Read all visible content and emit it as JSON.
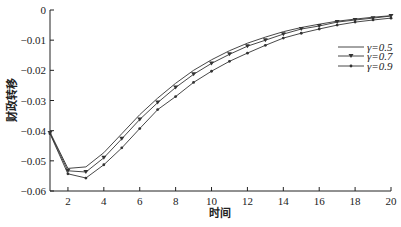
{
  "chart_data": {
    "type": "line",
    "title": "",
    "xlabel": "时间",
    "ylabel": "财政转移",
    "xlim": [
      1,
      20
    ],
    "ylim": [
      -0.06,
      0
    ],
    "grid": false,
    "legend_position": "upper right (inside)",
    "x_ticks": [
      2,
      4,
      6,
      8,
      10,
      12,
      14,
      16,
      18,
      20
    ],
    "y_ticks": [
      0,
      -0.01,
      -0.02,
      -0.03,
      -0.04,
      -0.05,
      -0.06
    ],
    "y_tick_labels": [
      "0",
      "-0.01",
      "-0.02",
      "-0.03",
      "-0.04",
      "-0.05",
      "-0.06"
    ],
    "x": [
      1,
      2,
      3,
      4,
      5,
      6,
      7,
      8,
      9,
      10,
      11,
      12,
      13,
      14,
      15,
      16,
      17,
      18,
      19,
      20
    ],
    "series": [
      {
        "name": "γ=0.5",
        "marker": "none",
        "values": [
          -0.0405,
          -0.0525,
          -0.052,
          -0.0473,
          -0.041,
          -0.0347,
          -0.0292,
          -0.0243,
          -0.02,
          -0.0165,
          -0.0135,
          -0.011,
          -0.009,
          -0.0072,
          -0.0058,
          -0.0047,
          -0.0037,
          -0.003,
          -0.0024,
          -0.0019
        ]
      },
      {
        "name": "γ=0.7",
        "marker": "triangle-down",
        "values": [
          -0.0408,
          -0.0533,
          -0.0537,
          -0.049,
          -0.0427,
          -0.0363,
          -0.0307,
          -0.0257,
          -0.0213,
          -0.0177,
          -0.0147,
          -0.012,
          -0.01,
          -0.008,
          -0.0063,
          -0.0053,
          -0.004,
          -0.0033,
          -0.0027,
          -0.002
        ]
      },
      {
        "name": "γ=0.9",
        "marker": "dot",
        "values": [
          -0.041,
          -0.0543,
          -0.0557,
          -0.0513,
          -0.0457,
          -0.0393,
          -0.033,
          -0.0287,
          -0.024,
          -0.0203,
          -0.017,
          -0.0143,
          -0.0117,
          -0.0093,
          -0.0077,
          -0.0063,
          -0.005,
          -0.004,
          -0.0033,
          -0.0027
        ]
      }
    ]
  },
  "colors": {
    "line": "#333333",
    "axis": "#222222",
    "background": "#ffffff"
  }
}
